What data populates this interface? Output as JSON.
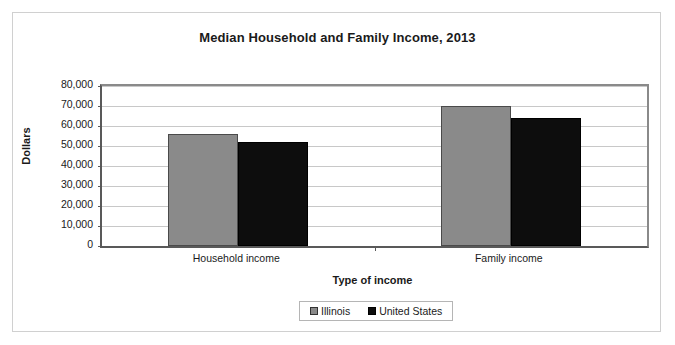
{
  "chart_data": {
    "type": "bar",
    "title": "Median Household and Family Income, 2013",
    "xlabel": "Type of income",
    "ylabel": "Dollars",
    "categories": [
      "Household income",
      "Family income"
    ],
    "series": [
      {
        "name": "Illinois",
        "color": "#8a8a8a",
        "values": [
          56200,
          70000
        ]
      },
      {
        "name": "United States",
        "color": "#0d0d0d",
        "values": [
          52250,
          64000
        ]
      }
    ],
    "ylim": [
      0,
      80000
    ],
    "ytick_labels": [
      "80,000",
      "70,000",
      "60,000",
      "50,000",
      "40,000",
      "30,000",
      "20,000",
      "10,000",
      "0"
    ],
    "ytick_values": [
      80000,
      70000,
      60000,
      50000,
      40000,
      30000,
      20000,
      10000,
      0
    ],
    "grid": true,
    "legend_position": "bottom"
  }
}
